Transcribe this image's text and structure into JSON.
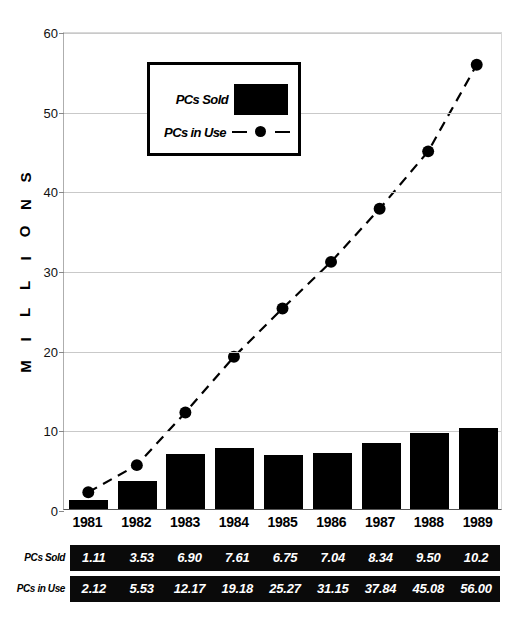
{
  "chart_data": {
    "type": "bar",
    "title": "",
    "subtitle": "",
    "xlabel": "",
    "ylabel": "MILLIONS",
    "ylim": [
      0,
      60
    ],
    "yticks": [
      0,
      10,
      20,
      30,
      40,
      50,
      60
    ],
    "grid": true,
    "legend_position": "upper-left-inside",
    "categories": [
      "1981",
      "1982",
      "1983",
      "1984",
      "1985",
      "1986",
      "1987",
      "1988",
      "1989"
    ],
    "series": [
      {
        "name": "PCs Sold",
        "type": "bar",
        "color": "#000000",
        "values": [
          1.11,
          3.53,
          6.9,
          7.61,
          6.75,
          7.04,
          8.34,
          9.5,
          10.2
        ],
        "labels": [
          "1.11",
          "3.53",
          "6.90",
          "7.61",
          "6.75",
          "7.04",
          "8.34",
          "9.50",
          "10.2"
        ]
      },
      {
        "name": "PCs in Use",
        "type": "line",
        "color": "#000000",
        "linestyle": "dashed",
        "marker": "circle",
        "values": [
          2.12,
          5.53,
          12.17,
          19.18,
          25.27,
          31.15,
          37.84,
          45.08,
          56.0
        ],
        "labels": [
          "2.12",
          "5.53",
          "12.17",
          "19.18",
          "25.27",
          "31.15",
          "37.84",
          "45.08",
          "56.00"
        ]
      }
    ]
  },
  "y_axis": {
    "title_letters": [
      "M",
      "I",
      "L",
      "L",
      "I",
      "O",
      "N",
      "S"
    ],
    "tick_labels": [
      "0",
      "10",
      "20",
      "30",
      "40",
      "50",
      "60"
    ]
  },
  "legend": {
    "sold_label": "PCs Sold",
    "inuse_label": "PCs in Use"
  },
  "table": {
    "rows": [
      {
        "header": "PCs Sold",
        "values": [
          "1.11",
          "3.53",
          "6.90",
          "7.61",
          "6.75",
          "7.04",
          "8.34",
          "9.50",
          "10.2"
        ]
      },
      {
        "header": "PCs in Use",
        "values": [
          "2.12",
          "5.53",
          "12.17",
          "19.18",
          "25.27",
          "31.15",
          "37.84",
          "45.08",
          "56.00"
        ]
      }
    ]
  }
}
